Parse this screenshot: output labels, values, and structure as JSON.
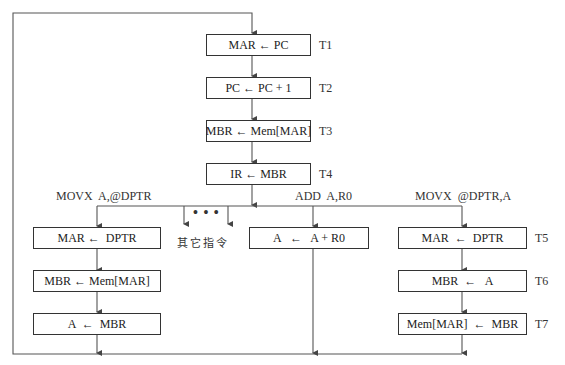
{
  "diagram": {
    "type": "instruction-cycle-flowchart",
    "fetch_steps": [
      {
        "op": "MAR ← PC",
        "time": "T1"
      },
      {
        "op": "PC ← PC + 1",
        "time": "T2"
      },
      {
        "op": "MBR ← Mem[MAR]",
        "time": "T3"
      },
      {
        "op": "IR ← MBR",
        "time": "T4"
      }
    ],
    "branches": [
      {
        "label": "MOVX  A,@DPTR",
        "steps": [
          {
            "op": "MAR ←  DPTR"
          },
          {
            "op": "MBR ← Mem[MAR]"
          },
          {
            "op": "A  ←  MBR"
          }
        ]
      },
      {
        "label": "",
        "other_label": "其它指令",
        "ellipsis": "• • •"
      },
      {
        "label": "ADD  A,R0",
        "steps": [
          {
            "op": "A   ←   A + R0"
          }
        ]
      },
      {
        "label": "MOVX  @DPTR,A",
        "steps": [
          {
            "op": "MAR  ←  DPTR",
            "time": "T5"
          },
          {
            "op": "MBR  ←   A",
            "time": "T6"
          },
          {
            "op": "Mem[MAR]  ←  MBR",
            "time": "T7"
          }
        ]
      }
    ],
    "colors": {
      "line": "#555555",
      "box_border": "#333333",
      "text": "#222222"
    }
  }
}
